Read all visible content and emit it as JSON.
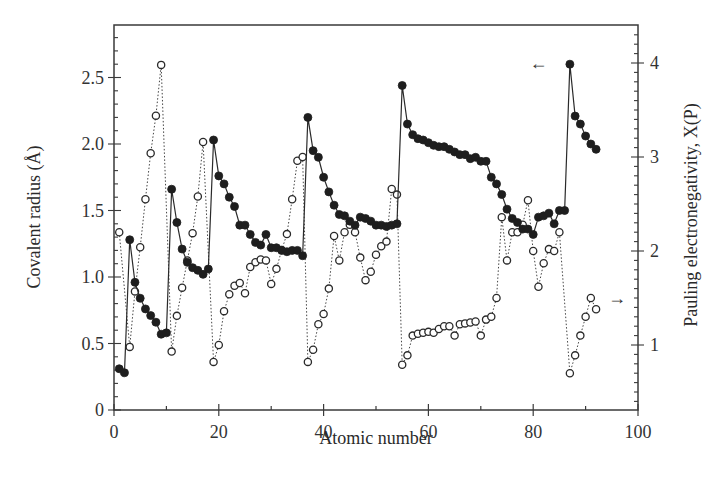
{
  "chart_data": {
    "type": "line",
    "title": "",
    "xlabel": "Atomic number",
    "ylabel": "Covalent radius (Å)",
    "ylabel_right": "Pauling electronegativity, X(P)",
    "xlim": [
      0,
      100
    ],
    "ylim": [
      0,
      2.85
    ],
    "ylim_right": [
      0.3,
      4.4
    ],
    "xticks": [
      0,
      20,
      40,
      60,
      80,
      100
    ],
    "yticks": [
      0,
      0.5,
      1.0,
      1.5,
      2.0,
      2.5
    ],
    "ytick_labels": [
      "0",
      "0.5",
      "1.0",
      "1.5",
      "2.0",
      "2.5"
    ],
    "yticks_right": [
      1,
      2,
      3,
      4
    ],
    "grid": false,
    "legend": "none (arrows indicate axis: ← left axis for filled circles, → right axis for open circles)",
    "annotations": [
      {
        "text": "←",
        "x": 81,
        "y_right": 4.0,
        "meaning": "filled series uses left axis"
      },
      {
        "text": "→",
        "x": 96,
        "y_right": 1.5,
        "meaning": "open series uses right axis"
      }
    ],
    "series": [
      {
        "name": "Covalent radius",
        "axis": "left",
        "marker": "filled-circle",
        "line": "solid",
        "x": [
          1,
          2,
          3,
          4,
          5,
          6,
          7,
          8,
          9,
          10,
          11,
          12,
          13,
          14,
          15,
          16,
          17,
          18,
          19,
          20,
          21,
          22,
          23,
          24,
          25,
          26,
          27,
          28,
          29,
          30,
          31,
          32,
          33,
          34,
          35,
          36,
          37,
          38,
          39,
          40,
          41,
          42,
          43,
          44,
          45,
          46,
          47,
          48,
          49,
          50,
          51,
          52,
          53,
          54,
          55,
          56,
          57,
          58,
          59,
          60,
          61,
          62,
          63,
          64,
          65,
          66,
          67,
          68,
          69,
          70,
          71,
          72,
          73,
          74,
          75,
          76,
          77,
          78,
          79,
          80,
          81,
          82,
          83,
          84,
          85,
          86,
          87,
          88,
          89,
          90,
          91,
          92
        ],
        "values": [
          0.31,
          0.28,
          1.28,
          0.96,
          0.84,
          0.76,
          0.71,
          0.66,
          0.57,
          0.58,
          1.66,
          1.41,
          1.21,
          1.11,
          1.07,
          1.05,
          1.02,
          1.06,
          2.03,
          1.76,
          1.7,
          1.6,
          1.53,
          1.39,
          1.39,
          1.32,
          1.26,
          1.24,
          1.32,
          1.22,
          1.22,
          1.2,
          1.19,
          1.2,
          1.2,
          1.16,
          2.2,
          1.95,
          1.9,
          1.75,
          1.64,
          1.54,
          1.47,
          1.46,
          1.42,
          1.39,
          1.45,
          1.44,
          1.42,
          1.39,
          1.39,
          1.38,
          1.39,
          1.4,
          2.44,
          2.15,
          2.07,
          2.04,
          2.03,
          2.01,
          1.99,
          1.98,
          1.98,
          1.96,
          1.94,
          1.92,
          1.92,
          1.89,
          1.9,
          1.87,
          1.87,
          1.75,
          1.7,
          1.62,
          1.51,
          1.44,
          1.41,
          1.36,
          1.36,
          1.32,
          1.45,
          1.46,
          1.48,
          1.4,
          1.5,
          1.5,
          2.6,
          2.21,
          2.15,
          2.06,
          2.0,
          1.96
        ]
      },
      {
        "name": "Pauling electronegativity",
        "axis": "right",
        "marker": "open-circle",
        "line": "dotted",
        "x": [
          1,
          3,
          4,
          5,
          6,
          7,
          8,
          9,
          11,
          12,
          13,
          14,
          15,
          16,
          17,
          19,
          20,
          21,
          22,
          23,
          24,
          25,
          26,
          27,
          28,
          29,
          30,
          31,
          32,
          33,
          34,
          35,
          36,
          37,
          38,
          39,
          40,
          41,
          42,
          43,
          44,
          45,
          46,
          47,
          48,
          49,
          50,
          51,
          52,
          53,
          54,
          55,
          56,
          57,
          58,
          59,
          60,
          61,
          62,
          63,
          64,
          65,
          66,
          67,
          68,
          69,
          70,
          71,
          72,
          73,
          74,
          75,
          76,
          77,
          78,
          79,
          80,
          81,
          82,
          83,
          84,
          85,
          87,
          88,
          89,
          90,
          91,
          92
        ],
        "values": [
          2.2,
          0.98,
          1.57,
          2.04,
          2.55,
          3.04,
          3.44,
          3.98,
          0.93,
          1.31,
          1.61,
          1.9,
          2.19,
          2.58,
          3.16,
          0.82,
          1.0,
          1.36,
          1.54,
          1.63,
          1.66,
          1.55,
          1.83,
          1.88,
          1.91,
          1.9,
          1.65,
          1.81,
          2.01,
          2.18,
          2.55,
          2.96,
          3.0,
          0.82,
          0.95,
          1.22,
          1.33,
          1.6,
          2.16,
          1.9,
          2.2,
          2.28,
          2.2,
          1.93,
          1.69,
          1.78,
          1.96,
          2.05,
          2.1,
          2.66,
          2.6,
          0.79,
          0.89,
          1.1,
          1.12,
          1.13,
          1.14,
          1.13,
          1.17,
          1.2,
          1.2,
          1.1,
          1.22,
          1.23,
          1.24,
          1.25,
          1.1,
          1.27,
          1.3,
          1.5,
          2.36,
          1.9,
          2.2,
          2.2,
          2.28,
          2.54,
          2.0,
          1.62,
          1.87,
          2.02,
          2.0,
          2.2,
          0.7,
          0.89,
          1.1,
          1.3,
          1.5,
          1.38
        ]
      }
    ]
  }
}
